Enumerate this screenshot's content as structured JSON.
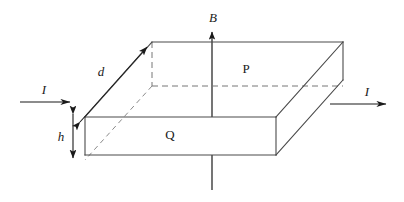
{
  "figure": {
    "labels": {
      "magnetic_field": "B",
      "current_in": "I",
      "current_out": "I",
      "depth": "d",
      "height": "h",
      "top_face": "P",
      "front_face": "Q"
    },
    "colors": {
      "solid_edge": "#4a4a4a",
      "hidden_edge": "#777777",
      "vector": "#1a1a1a",
      "text": "#1a1a1a",
      "background": "#ffffff"
    },
    "geometry": {
      "description": "Rectangular conducting slab drawn in oblique projection. Current I enters the left face and exits the right face; magnetic field B points vertically upward through the top face P. Depth d is marked along the receding left edge and thickness h along the front-left vertical edge.",
      "top_back_left": [
        152,
        42
      ],
      "top_back_right": [
        343,
        42
      ],
      "top_front_right": [
        276,
        117
      ],
      "top_front_left": [
        85,
        117
      ],
      "bottom_front_left": [
        85,
        155
      ],
      "bottom_front_right": [
        276,
        155
      ],
      "bottom_back_right": [
        343,
        80
      ],
      "hidden_back_left_bottom": [
        152,
        86
      ]
    },
    "annotations": {
      "field_direction": "up",
      "current_direction": "left to right",
      "top_face_marker": "P",
      "bottom_front_face_marker": "Q"
    }
  }
}
